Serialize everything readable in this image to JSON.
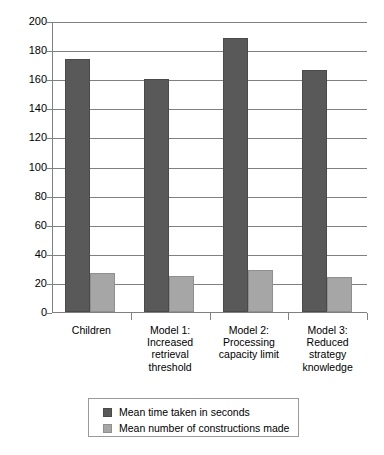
{
  "chart_data": {
    "type": "bar",
    "title": "",
    "subtitle": "",
    "xlabel": "",
    "ylabel": "",
    "ylim": [
      0,
      200
    ],
    "ytick_step": 20,
    "yticks": [
      "0",
      "20",
      "40",
      "60",
      "80",
      "100",
      "120",
      "140",
      "160",
      "180",
      "200"
    ],
    "grid": true,
    "grid_axis": "y",
    "legend_position": "bottom-center",
    "categories": [
      "Children",
      "Model 1: Increased retrieval threshold",
      "Model 2: Processing capacity limit",
      "Model 3: Reduced strategy knowledge"
    ],
    "category_lines": [
      [
        "Children"
      ],
      [
        "Model 1:",
        "Increased",
        "retrieval",
        "threshold"
      ],
      [
        "Model 2:",
        "Processing",
        "capacity limit"
      ],
      [
        "Model 3:",
        "Reduced",
        "strategy",
        "knowledge"
      ]
    ],
    "series": [
      {
        "name": "Mean time taken in seconds",
        "color": "#595959",
        "values": [
          174,
          160,
          188,
          166
        ]
      },
      {
        "name": "Mean number of constructions made",
        "color": "#a6a6a6",
        "values": [
          27,
          25,
          29,
          24
        ]
      }
    ]
  },
  "legend": {
    "items": [
      {
        "label": "Mean time taken in seconds",
        "color": "#595959"
      },
      {
        "label": "Mean number of constructions made",
        "color": "#a6a6a6"
      }
    ]
  },
  "axis": {
    "y_min_label": "0",
    "y_max_label": "200"
  },
  "colors": {
    "series_dark": "#595959",
    "series_light": "#a6a6a6",
    "gridline": "#808080",
    "axis": "#808080",
    "background": "#ffffff",
    "text": "#000000"
  }
}
